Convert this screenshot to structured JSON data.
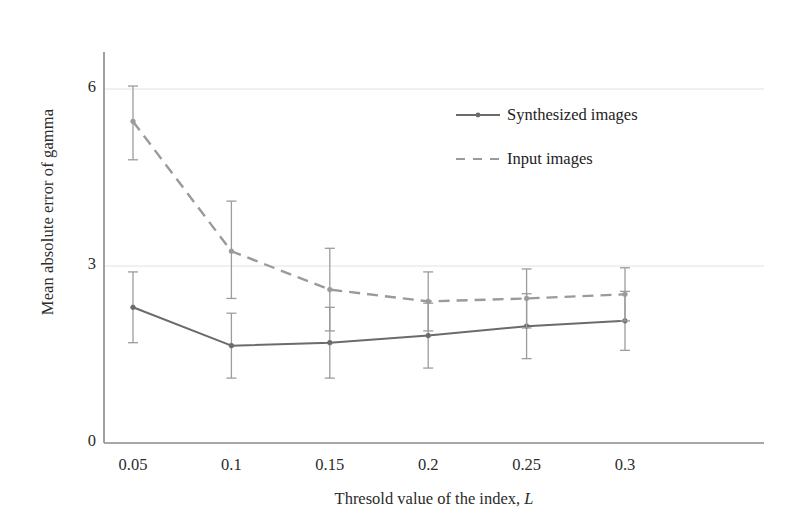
{
  "chart_data": {
    "type": "line",
    "title": "",
    "xlabel": "Thresold value of the index, L",
    "xlabel_plain": "Thresold value of the index,",
    "xlabel_italic": "L",
    "ylabel": "Mean absolute error of gamma",
    "x": [
      0.05,
      0.1,
      0.15,
      0.2,
      0.25,
      0.3
    ],
    "xtick_labels": [
      "0.05",
      "0.1",
      "0.15",
      "0.2",
      "0.25",
      "0.3"
    ],
    "ytick_labels": [
      "0",
      "3",
      "6"
    ],
    "yticks": [
      0,
      3,
      6
    ],
    "xlim": [
      0.025,
      0.325
    ],
    "ylim": [
      0,
      6.9
    ],
    "grid": "horizontal-faint",
    "legend_position": "upper-right-inside",
    "series": [
      {
        "name": "Synthesized images",
        "style": "solid",
        "marker": "dot",
        "color": "#6b6b6b",
        "values": [
          2.3,
          1.65,
          1.7,
          1.82,
          1.98,
          2.07
        ],
        "error_lower": [
          0.6,
          0.55,
          0.6,
          0.55,
          0.55,
          0.5
        ],
        "error_upper": [
          0.6,
          0.55,
          0.6,
          0.55,
          0.55,
          0.5
        ]
      },
      {
        "name": "Input images",
        "style": "dashed",
        "marker": "dot",
        "color": "#9a9a9a",
        "values": [
          5.45,
          3.25,
          2.6,
          2.4,
          2.45,
          2.52
        ],
        "error_lower": [
          0.65,
          0.8,
          0.7,
          0.5,
          0.5,
          0.45
        ],
        "error_upper": [
          0.6,
          0.85,
          0.7,
          0.5,
          0.5,
          0.45
        ]
      }
    ]
  },
  "legend": {
    "items": [
      {
        "label": "Synthesized images",
        "style": "solid",
        "color": "#6b6b6b"
      },
      {
        "label": "Input images",
        "style": "dashed",
        "color": "#9a9a9a"
      }
    ]
  },
  "axis": {
    "y_title": "Mean absolute error of gamma",
    "x_title_plain": "Thresold value of the index,",
    "x_title_italic": "L"
  }
}
